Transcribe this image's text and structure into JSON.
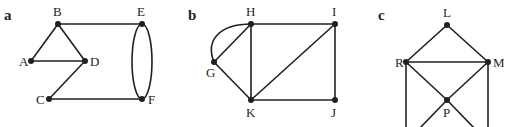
{
  "panels": [
    {
      "label": "a",
      "vertices": {
        "A": {
          "x": 31,
          "y": 61,
          "lx": 20,
          "ly": 66
        },
        "B": {
          "x": 58,
          "y": 24,
          "lx": 53,
          "ly": 15
        },
        "C": {
          "x": 49,
          "y": 99,
          "lx": 36,
          "ly": 104
        },
        "D": {
          "x": 85,
          "y": 61,
          "lx": 90,
          "ly": 66
        },
        "E": {
          "x": 142,
          "y": 24,
          "lx": 137,
          "ly": 15
        },
        "F": {
          "x": 142,
          "y": 99,
          "lx": 148,
          "ly": 104
        }
      },
      "edges": [
        [
          "A",
          "B"
        ],
        [
          "B",
          "D"
        ],
        [
          "A",
          "D"
        ],
        [
          "D",
          "C"
        ],
        [
          "C",
          "F"
        ],
        [
          "B",
          "E"
        ]
      ],
      "multi_edges": [
        [
          "E",
          "F"
        ]
      ]
    },
    {
      "label": "b",
      "vertices": {
        "G": {
          "x": 214,
          "y": 62,
          "lx": 206,
          "ly": 76
        },
        "H": {
          "x": 251,
          "y": 24,
          "lx": 246,
          "ly": 15
        },
        "I": {
          "x": 335,
          "y": 24,
          "lx": 332,
          "ly": 15
        },
        "J": {
          "x": 335,
          "y": 100,
          "lx": 331,
          "ly": 116
        },
        "K": {
          "x": 251,
          "y": 100,
          "lx": 246,
          "ly": 116
        }
      },
      "edges": [
        [
          "G",
          "H"
        ],
        [
          "G",
          "K"
        ],
        [
          "H",
          "I"
        ],
        [
          "H",
          "K"
        ],
        [
          "K",
          "I"
        ],
        [
          "I",
          "J"
        ],
        [
          "K",
          "J"
        ]
      ],
      "curved_edges": [
        [
          "G",
          "H"
        ]
      ]
    },
    {
      "label": "c",
      "vertices": {
        "L": {
          "x": 447,
          "y": 25,
          "lx": 443,
          "ly": 16
        },
        "R": {
          "x": 406,
          "y": 62,
          "lx": 395,
          "ly": 67
        },
        "M": {
          "x": 488,
          "y": 62,
          "lx": 493,
          "ly": 67
        },
        "P": {
          "x": 447,
          "y": 100,
          "lx": 443,
          "ly": 116
        }
      },
      "edges": [
        [
          "L",
          "R"
        ],
        [
          "L",
          "M"
        ],
        [
          "R",
          "M"
        ],
        [
          "R",
          "P"
        ],
        [
          "M",
          "P"
        ]
      ],
      "offscreen_edges": [
        "R-down",
        "M-down",
        "P-down-left",
        "P-down-right"
      ]
    }
  ]
}
